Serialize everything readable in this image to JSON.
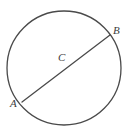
{
  "figure": {
    "background_color": "#ffffff",
    "stroke_color": "#4a4a4a",
    "label_color": "#3d3d3d",
    "stroke_width": 1.3,
    "width": 133,
    "height": 135
  },
  "shapes": {
    "circle": {
      "name": "circle",
      "center_x": 64,
      "center_y": 68,
      "radius": 57
    },
    "diameter": {
      "name": "diameter-segment",
      "from_label": "A",
      "to_label": "B",
      "x1": 22,
      "y1": 102,
      "x2": 110,
      "y2": 35
    }
  },
  "labels": {
    "a": "A",
    "b": "B",
    "c": "C"
  }
}
